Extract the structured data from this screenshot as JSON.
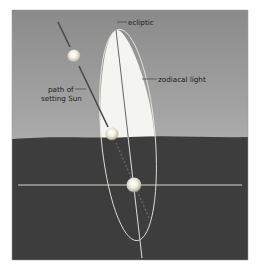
{
  "figure": {
    "labels": {
      "ecliptic": "ecliptic",
      "zodiacal_light": "zodiacal light",
      "path_line1": "path of",
      "path_line2": "setting Sun"
    },
    "colors": {
      "sky_top": "#8c8c8c",
      "sky_bottom": "#a9a9a9",
      "ground": "#3d3d3d",
      "zodiacal_light": "#f4f4f2",
      "lines": "#e8e8e0",
      "sun_path": "#4a4a4a"
    },
    "suns": [
      {
        "name": "sun-above",
        "cx": 74,
        "cy": 56
      },
      {
        "name": "sun-horizon",
        "cx": 112,
        "cy": 134
      },
      {
        "name": "sun-below",
        "cx": 134,
        "cy": 185
      }
    ]
  }
}
